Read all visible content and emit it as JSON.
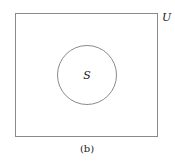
{
  "diagram": {
    "type": "venn",
    "universe_label": "U",
    "set_label": "S",
    "caption": "(b)",
    "colors": {
      "stroke": "#8a8a8a",
      "text": "#222222",
      "background": "#ffffff"
    }
  }
}
